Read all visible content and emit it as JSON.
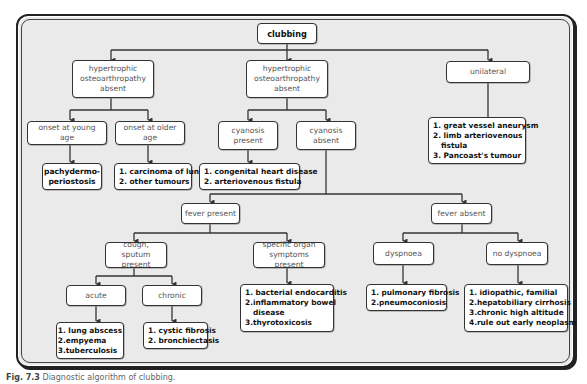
{
  "diagram": {
    "title": "Diagnostic algorithm of clubbing",
    "root": {
      "label": "clubbing"
    },
    "level1": {
      "hoa_absent_left": {
        "lines": [
          "hypertrophic",
          "osteoarthropathy",
          "absent"
        ]
      },
      "hoa_absent_center": {
        "lines": [
          "hypertrophic",
          "osteoarthropathy",
          "absent"
        ]
      },
      "unilateral": {
        "label": "unilateral"
      }
    },
    "left_branch": {
      "onset_young": {
        "label": "onset at young age"
      },
      "onset_older": {
        "label": "onset at older age"
      },
      "young_result": {
        "lines": [
          "pachydermo-",
          "periostosis"
        ]
      },
      "older_result": {
        "items": [
          "1. carcinoma of lung",
          "2. other tumours"
        ]
      }
    },
    "center_branch": {
      "cyanosis_present": {
        "lines": [
          "cyanosis",
          "present"
        ]
      },
      "cyanosis_absent": {
        "lines": [
          "cyanosis",
          "absent"
        ]
      },
      "cyanosis_present_result": {
        "items": [
          "1. congenital heart disease",
          "2. arteriovenous fistula"
        ]
      }
    },
    "unilateral_result": {
      "items": [
        "1. great vessel aneurysm",
        "2. limb arteriovenous",
        "fistula",
        "3. Pancoast's tumour"
      ]
    },
    "fever": {
      "present": {
        "label": "fever present"
      },
      "absent": {
        "label": "fever absent"
      }
    },
    "fever_present_branch": {
      "cough": {
        "lines": [
          "cough,",
          "sputum present"
        ]
      },
      "specific_organ": {
        "lines": [
          "specific organ",
          "symptoms present"
        ]
      },
      "acute": {
        "label": "acute"
      },
      "chronic": {
        "label": "chronic"
      },
      "acute_result": {
        "items": [
          "1. lung abscess",
          "2.empyema",
          "3.tuberculosis"
        ]
      },
      "chronic_result": {
        "items": [
          "1. cystic fibrosis",
          "2. bronchiectasis"
        ]
      },
      "specific_organ_result": {
        "items": [
          "1. bacterial endocarditis",
          "2.inflammatory bowel",
          "disease",
          "3.thyrotoxicosis"
        ]
      }
    },
    "fever_absent_branch": {
      "dyspnoea": {
        "label": "dyspnoea"
      },
      "no_dyspnoea": {
        "label": "no dyspnoea"
      },
      "dyspnoea_result": {
        "items": [
          "1. pulmonary fibrosis",
          "2.pneumoconiosis"
        ]
      },
      "no_dyspnoea_result": {
        "items": [
          "1. idiopathic, familial",
          "2.hepatobiliary cirrhosis",
          "3.chronic high altitude",
          "4.rule out early neoplasm"
        ]
      }
    }
  },
  "caption": {
    "figure_label": "Fig. 7.3",
    "text": "Diagnostic algorithm of clubbing."
  },
  "colors": {
    "frame_bg": "#eaeaea",
    "box_bg": "#ffffff",
    "line": "#333333"
  }
}
